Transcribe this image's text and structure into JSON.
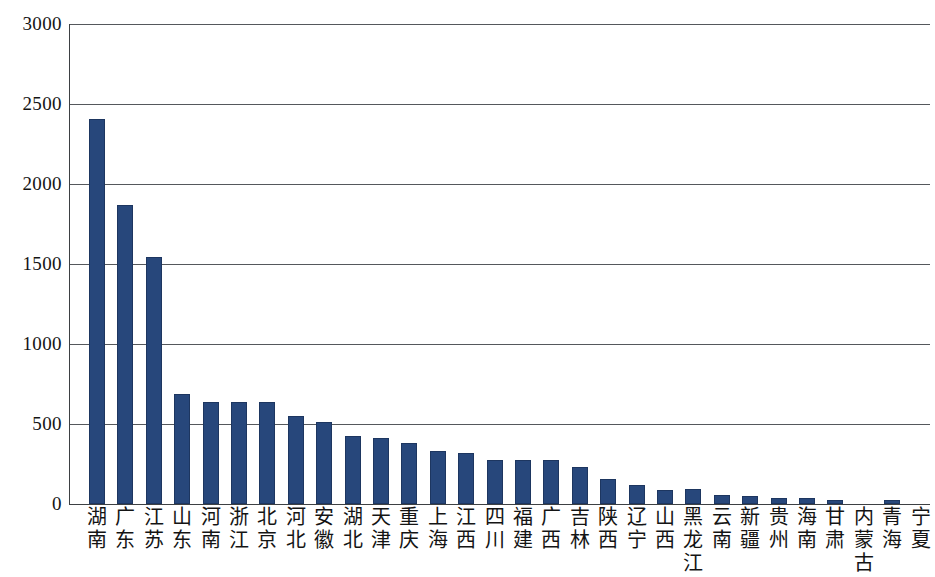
{
  "chart_data": {
    "type": "bar",
    "title": "",
    "subtitle": "",
    "xlabel": "",
    "ylabel": "",
    "ylim": [
      0,
      3000
    ],
    "ytick_labels": [
      "3000",
      "2500",
      "2000",
      "1500",
      "1000",
      "500",
      "0"
    ],
    "yticks": [
      3000,
      2500,
      2000,
      1500,
      1000,
      500,
      0
    ],
    "grid": true,
    "legend": null,
    "series_color": "#27477b",
    "categories": [
      "湖南",
      "广东",
      "江苏",
      "山东",
      "河南",
      "浙江",
      "北京",
      "河北",
      "安徽",
      "湖北",
      "天津",
      "重庆",
      "上海",
      "江西",
      "四川",
      "福建",
      "广西",
      "吉林",
      "陕西",
      "辽宁",
      "山西",
      "黑龙江",
      "云南",
      "新疆",
      "贵州",
      "海南",
      "甘肃",
      "内蒙古",
      "青海",
      "宁夏"
    ],
    "values": [
      2408,
      1870,
      1541,
      687,
      640,
      640,
      635,
      547,
      513,
      428,
      410,
      381,
      333,
      321,
      273,
      273,
      273,
      230,
      155,
      118,
      86,
      92,
      55,
      49,
      40,
      37,
      25,
      0,
      28,
      0
    ]
  },
  "axis": {
    "y_labels": [
      "3000",
      "2500",
      "2000",
      "1500",
      "1000",
      "500",
      "0"
    ]
  }
}
